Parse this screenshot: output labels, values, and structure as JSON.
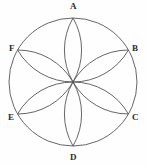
{
  "figure": {
    "name": "six-petal-rosette-in-circle",
    "background_color": "#fefefe",
    "stroke_color": "#555555",
    "stroke_width": 0.9,
    "circle": {
      "center_x": 73,
      "center_y": 82,
      "radius": 64
    },
    "label_color": "#2b2b2b",
    "label_font_size": 9
  },
  "vertices": [
    {
      "id": "A",
      "label": "A",
      "angle_deg": 90,
      "x": 73,
      "y": 18,
      "label_x": 70,
      "label_y": 2
    },
    {
      "id": "B",
      "label": "B",
      "angle_deg": 30,
      "x": 128,
      "y": 50,
      "label_x": 132,
      "label_y": 44
    },
    {
      "id": "C",
      "label": "C",
      "angle_deg": -30,
      "x": 128,
      "y": 114,
      "label_x": 132,
      "label_y": 113
    },
    {
      "id": "D",
      "label": "D",
      "angle_deg": -90,
      "x": 73,
      "y": 146,
      "label_x": 70,
      "label_y": 153
    },
    {
      "id": "E",
      "label": "E",
      "angle_deg": 210,
      "x": 18,
      "y": 114,
      "label_x": 8,
      "label_y": 113
    },
    {
      "id": "F",
      "label": "F",
      "angle_deg": 150,
      "x": 18,
      "y": 50,
      "label_x": 9,
      "label_y": 44
    }
  ],
  "petals": [
    {
      "id": "petal-A",
      "from": "center",
      "to": "A"
    },
    {
      "id": "petal-B",
      "from": "center",
      "to": "B"
    },
    {
      "id": "petal-C",
      "from": "center",
      "to": "C"
    },
    {
      "id": "petal-D",
      "from": "center",
      "to": "D"
    },
    {
      "id": "petal-E",
      "from": "center",
      "to": "E"
    },
    {
      "id": "petal-F",
      "from": "center",
      "to": "F"
    }
  ],
  "chart_data": {
    "type": "diagram",
    "title": "",
    "point_labels": [
      "A",
      "B",
      "C",
      "D",
      "E",
      "F"
    ],
    "point_angles_deg": [
      90,
      30,
      -30,
      -90,
      210,
      150
    ],
    "petal_count": 6,
    "circle_radius": 64
  }
}
